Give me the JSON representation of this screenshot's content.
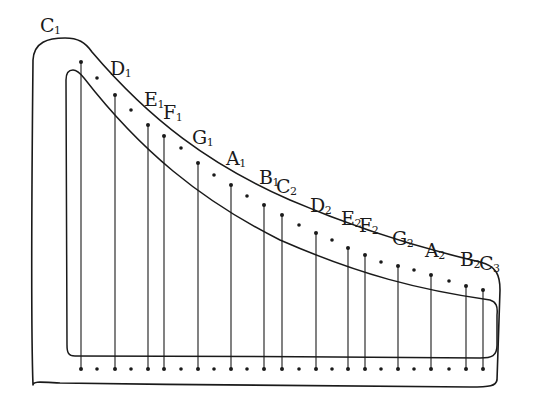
{
  "diagram": {
    "type": "harp-string-layout",
    "ink_color": "#1a1a1a",
    "background": "#ffffff",
    "string_bottom_y": 369,
    "strings": [
      {
        "note": "C",
        "octave": "1",
        "x": 81,
        "top": 62,
        "label_x": 40,
        "label_y": 16
      },
      {
        "note": "D",
        "octave": "1",
        "x": 115,
        "top": 95,
        "label_x": 110,
        "label_y": 59
      },
      {
        "note": "E",
        "octave": "1",
        "x": 148,
        "top": 125,
        "label_x": 144,
        "label_y": 90
      },
      {
        "note": "F",
        "octave": "1",
        "x": 164,
        "top": 136,
        "label_x": 163,
        "label_y": 103
      },
      {
        "note": "G",
        "octave": "1",
        "x": 198,
        "top": 163,
        "label_x": 192,
        "label_y": 128
      },
      {
        "note": "A",
        "octave": "1",
        "x": 231,
        "top": 185,
        "label_x": 226,
        "label_y": 149
      },
      {
        "note": "B",
        "octave": "1",
        "x": 264,
        "top": 205,
        "label_x": 259,
        "label_y": 168
      },
      {
        "note": "C",
        "octave": "2",
        "x": 282,
        "top": 215,
        "label_x": 276,
        "label_y": 177
      },
      {
        "note": "D",
        "octave": "2",
        "x": 316,
        "top": 233,
        "label_x": 310,
        "label_y": 196
      },
      {
        "note": "E",
        "octave": "2",
        "x": 348,
        "top": 248,
        "label_x": 341,
        "label_y": 209
      },
      {
        "note": "F",
        "octave": "2",
        "x": 365,
        "top": 255,
        "label_x": 359,
        "label_y": 216
      },
      {
        "note": "G",
        "octave": "2",
        "x": 398,
        "top": 266,
        "label_x": 392,
        "label_y": 229
      },
      {
        "note": "A",
        "octave": "2",
        "x": 431,
        "top": 275,
        "label_x": 425,
        "label_y": 241
      },
      {
        "note": "B",
        "octave": "2",
        "x": 466,
        "top": 286,
        "label_x": 460,
        "label_y": 250
      },
      {
        "note": "C",
        "octave": "3",
        "x": 483,
        "top": 290,
        "label_x": 479,
        "label_y": 254
      }
    ],
    "chromatic_dots": [
      {
        "x": 97,
        "top": 78,
        "bottom": 369
      },
      {
        "x": 131,
        "top": 110,
        "bottom": 369
      },
      {
        "x": 181,
        "top": 148,
        "bottom": 369
      },
      {
        "x": 214,
        "top": 175,
        "bottom": 369
      },
      {
        "x": 247,
        "top": 196,
        "bottom": 369
      },
      {
        "x": 299,
        "top": 225,
        "bottom": 369
      },
      {
        "x": 332,
        "top": 240,
        "bottom": 369
      },
      {
        "x": 381,
        "top": 262,
        "bottom": 369
      },
      {
        "x": 414,
        "top": 270,
        "bottom": 369
      },
      {
        "x": 449,
        "top": 281,
        "bottom": 369
      }
    ],
    "outer_frame_path": "M33 385 C31 330 32 160 33 60 C34 42 48 38 65 38 C78 38 85 42 92 52 C150 120 210 165 290 200 C360 230 420 248 480 262 C497 266 500 276 500 290 L497 380 C496 386 490 387 470 387 C350 386 200 385 60 383 C40 382 33 381 33 385 Z",
    "inner_frame_path": "M67 345 L66 80 C66 72 70 70 73 70 C77 70 80 73 84 78 C140 150 200 200 280 240 C360 275 420 290 490 300 C496 302 498 306 497 315 L497 345 C497 356 492 358 480 358 C350 357 200 356 75 356 C68 356 67 352 67 345 Z"
  }
}
